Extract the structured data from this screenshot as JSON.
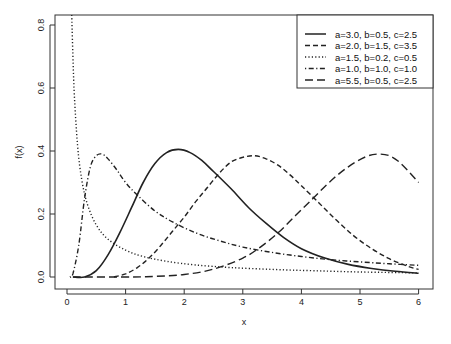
{
  "chart_data": {
    "type": "line",
    "title": "",
    "xlabel": "x",
    "ylabel": "f(x)",
    "xlim": [
      -0.2,
      6.25
    ],
    "ylim": [
      -0.035,
      0.835
    ],
    "xticks": [
      0,
      1,
      2,
      3,
      4,
      5,
      6
    ],
    "yticks": [
      0.0,
      0.2,
      0.4,
      0.6,
      0.8
    ],
    "ytick_labels": [
      "0.0",
      "0.2",
      "0.4",
      "0.6",
      "0.8"
    ],
    "grid": false,
    "legend_position": "top-right",
    "series": [
      {
        "name": "a=3.0, b=0.5, c=2.5",
        "linestyle": "solid",
        "x": [
          0.1,
          0.3,
          0.5,
          0.7,
          0.9,
          1.1,
          1.3,
          1.5,
          1.7,
          1.9,
          2.1,
          2.3,
          2.5,
          2.8,
          3.1,
          3.4,
          3.7,
          4.0,
          4.4,
          4.8,
          5.2,
          5.6,
          6.0
        ],
        "y": [
          0.0,
          0.0,
          0.02,
          0.07,
          0.14,
          0.22,
          0.3,
          0.36,
          0.395,
          0.405,
          0.395,
          0.37,
          0.335,
          0.28,
          0.22,
          0.17,
          0.125,
          0.09,
          0.06,
          0.04,
          0.027,
          0.018,
          0.012
        ]
      },
      {
        "name": "a=2.0, b=1.5, c=3.5",
        "linestyle": "dashed",
        "x": [
          0.8,
          1.0,
          1.2,
          1.4,
          1.6,
          1.8,
          2.0,
          2.2,
          2.4,
          2.6,
          2.8,
          3.0,
          3.2,
          3.4,
          3.6,
          3.8,
          4.0,
          4.3,
          4.6,
          4.9,
          5.2,
          5.5,
          5.8,
          6.0
        ],
        "y": [
          0.0,
          0.01,
          0.03,
          0.06,
          0.1,
          0.145,
          0.19,
          0.24,
          0.285,
          0.33,
          0.365,
          0.38,
          0.385,
          0.375,
          0.355,
          0.325,
          0.29,
          0.235,
          0.18,
          0.13,
          0.09,
          0.058,
          0.035,
          0.024
        ]
      },
      {
        "name": "a=1.5, b=0.2, c=0.5",
        "linestyle": "dotted",
        "x": [
          0.08,
          0.12,
          0.18,
          0.25,
          0.35,
          0.5,
          0.7,
          1.0,
          1.3,
          1.7,
          2.2,
          2.8,
          3.5,
          4.2,
          5.0,
          6.0
        ],
        "y": [
          0.84,
          0.6,
          0.42,
          0.31,
          0.23,
          0.165,
          0.12,
          0.085,
          0.065,
          0.05,
          0.038,
          0.03,
          0.024,
          0.02,
          0.016,
          0.013
        ]
      },
      {
        "name": "a=1.0, b=1.0, c=1.0",
        "linestyle": "dotdash",
        "x": [
          0.05,
          0.1,
          0.2,
          0.3,
          0.4,
          0.5,
          0.6,
          0.7,
          0.85,
          1.0,
          1.2,
          1.5,
          1.8,
          2.2,
          2.6,
          3.0,
          3.5,
          4.0,
          4.5,
          5.0,
          5.5,
          6.0
        ],
        "y": [
          0.0,
          0.01,
          0.1,
          0.25,
          0.35,
          0.385,
          0.39,
          0.375,
          0.34,
          0.3,
          0.26,
          0.21,
          0.175,
          0.14,
          0.115,
          0.095,
          0.078,
          0.065,
          0.055,
          0.048,
          0.042,
          0.037
        ]
      },
      {
        "name": "a=5.5, b=0.5, c=2.5",
        "linestyle": "longdash",
        "x": [
          0.1,
          1.0,
          1.5,
          2.0,
          2.5,
          3.0,
          3.3,
          3.6,
          3.9,
          4.2,
          4.5,
          4.8,
          5.1,
          5.3,
          5.5,
          5.7,
          6.0
        ],
        "y": [
          0.0,
          0.0,
          0.002,
          0.008,
          0.025,
          0.06,
          0.095,
          0.14,
          0.195,
          0.25,
          0.305,
          0.35,
          0.382,
          0.39,
          0.385,
          0.36,
          0.3
        ]
      }
    ]
  }
}
